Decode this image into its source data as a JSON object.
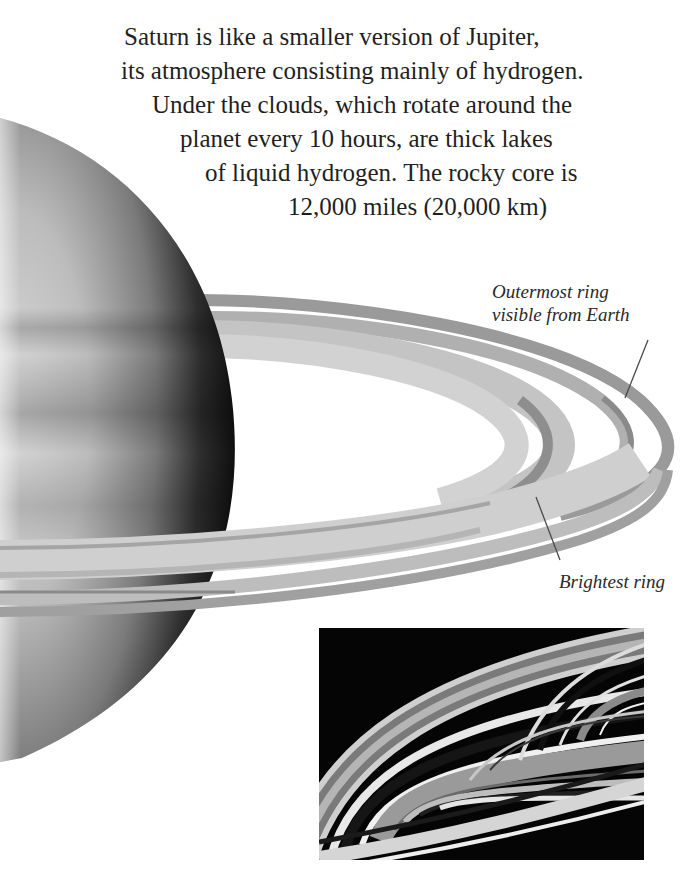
{
  "intro": {
    "lines": [
      "Saturn is like a smaller version of Jupiter,",
      "its atmosphere consisting mainly of hydrogen.",
      "Under the clouds, which rotate around the",
      "planet every 10 hours, are thick lakes",
      "of liquid hydrogen. The rocky core is",
      "12,000 miles (20,000 km)"
    ]
  },
  "labels": {
    "outermost_ring": [
      "Outermost ring",
      "visible from Earth"
    ],
    "brightest_ring": "Brightest ring"
  },
  "illustration": {
    "subject": "Saturn with rings",
    "inset": "close-up photograph of ring bands"
  },
  "colors": {
    "background": "#ffffff",
    "text": "#1f1f1f",
    "ring_dark": "#8c8c8c",
    "ring_light": "#bdbdbd",
    "inset_bg": "#050505"
  }
}
